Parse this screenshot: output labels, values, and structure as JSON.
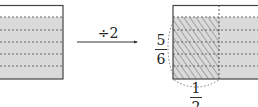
{
  "diagram": {
    "operation_label": "÷2",
    "left_rect": {
      "description": "rectangle with 5 of 6 horizontal parts shaded",
      "shaded_parts": 5,
      "total_parts": 6
    },
    "right_rect": {
      "description": "rectangle with 5/6 shaded, left half hatched",
      "vertical_fraction": {
        "numerator": "5",
        "denominator": "6"
      },
      "horizontal_fraction": {
        "numerator": "1",
        "denominator": "2"
      }
    },
    "colors": {
      "shade": "#d8d8d8",
      "border": "#444444",
      "hatch": "#666666",
      "dash": "#555555"
    }
  }
}
